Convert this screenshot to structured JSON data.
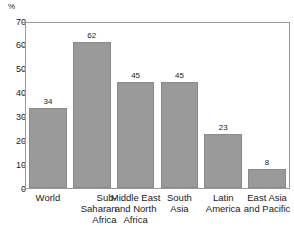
{
  "chart_data": {
    "type": "bar",
    "title": "",
    "subtitle": "",
    "xlabel": "",
    "ylabel": "%",
    "ylim": [
      0,
      70
    ],
    "ytick_step": 10,
    "yticks": [
      "0",
      "10",
      "20",
      "30",
      "40",
      "50",
      "60",
      "70"
    ],
    "grid": false,
    "legend": null,
    "categories": [
      "World",
      "Sub-Saharan Africa",
      "Middle East and North Africa",
      "South Asia",
      "Latin America",
      "East Asia and Pacific"
    ],
    "category_lines": [
      [
        "World"
      ],
      [
        "Sub-Saharan",
        "Africa"
      ],
      [
        "Middle East",
        "and North",
        "Africa"
      ],
      [
        "South",
        "Asia"
      ],
      [
        "Latin",
        "America"
      ],
      [
        "East Asia",
        "and Pacific"
      ]
    ],
    "values": [
      34,
      62,
      45,
      45,
      23,
      8
    ],
    "value_labels": [
      "34",
      "62",
      "45",
      "45",
      "23",
      "8"
    ],
    "bar_color": "#9a9a9a",
    "bar_edge_color": "#8a8a8a",
    "axis_color": "#9a9a9a",
    "text_color": "#1a1a1a",
    "background": "#ffffff"
  }
}
